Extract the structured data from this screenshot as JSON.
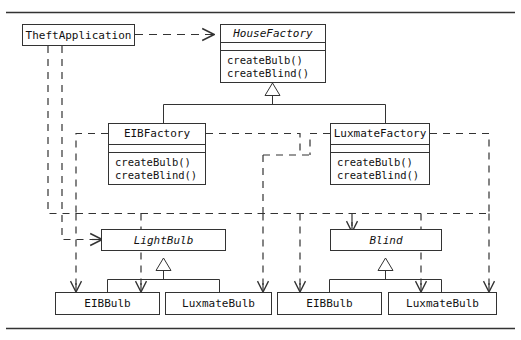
{
  "figure": {
    "type": "uml-class-diagram",
    "pattern": "Abstract Factory",
    "width": 521,
    "height": 340,
    "line_color": "#333333",
    "text_color": "#111111",
    "background": "#ffffff"
  },
  "classes": {
    "theft_application": {
      "name": "TheftApplication",
      "abstract": false,
      "compartments": 1,
      "operations": []
    },
    "house_factory": {
      "name": "HouseFactory",
      "abstract": true,
      "compartments": 3,
      "operations": [
        "createBulb()",
        "createBlind()"
      ]
    },
    "eib_factory": {
      "name": "EIBFactory",
      "abstract": false,
      "compartments": 3,
      "operations": [
        "createBulb()",
        "createBlind()"
      ]
    },
    "luxmate_factory": {
      "name": "LuxmateFactory",
      "abstract": false,
      "compartments": 3,
      "operations": [
        "createBulb()",
        "createBlind()"
      ]
    },
    "light_bulb": {
      "name": "LightBulb",
      "abstract": true,
      "compartments": 1,
      "operations": []
    },
    "blind": {
      "name": "Blind",
      "abstract": true,
      "compartments": 1,
      "operations": []
    },
    "eib_bulb_left": {
      "name": "EIBBulb",
      "abstract": false,
      "compartments": 1,
      "operations": []
    },
    "luxmate_bulb_left": {
      "name": "LuxmateBulb",
      "abstract": false,
      "compartments": 1,
      "operations": []
    },
    "eib_bulb_right": {
      "name": "EIBBulb",
      "abstract": false,
      "compartments": 1,
      "operations": []
    },
    "luxmate_bulb_right": {
      "name": "LuxmateBulb",
      "abstract": false,
      "compartments": 1,
      "operations": []
    }
  },
  "relationships": [
    {
      "kind": "dependency",
      "style": "dashed",
      "from": "TheftApplication",
      "to": "HouseFactory"
    },
    {
      "kind": "dependency",
      "style": "dashed",
      "from": "TheftApplication",
      "to": "LightBulb"
    },
    {
      "kind": "dependency",
      "style": "dashed",
      "from": "TheftApplication",
      "to": "Blind"
    },
    {
      "kind": "generalization",
      "style": "solid",
      "from": "EIBFactory",
      "to": "HouseFactory"
    },
    {
      "kind": "generalization",
      "style": "solid",
      "from": "LuxmateFactory",
      "to": "HouseFactory"
    },
    {
      "kind": "generalization",
      "style": "solid",
      "from": "EIBBulb",
      "to": "LightBulb"
    },
    {
      "kind": "generalization",
      "style": "solid",
      "from": "LuxmateBulb",
      "to": "LightBulb"
    },
    {
      "kind": "generalization",
      "style": "solid",
      "from": "EIBBulb",
      "to": "Blind"
    },
    {
      "kind": "generalization",
      "style": "solid",
      "from": "LuxmateBulb",
      "to": "Blind"
    },
    {
      "kind": "dependency",
      "style": "dashed",
      "from": "EIBFactory",
      "to": "EIBBulb"
    },
    {
      "kind": "dependency",
      "style": "dashed",
      "from": "EIBFactory",
      "to": "EIBBulb (Blind)"
    },
    {
      "kind": "dependency",
      "style": "dashed",
      "from": "LuxmateFactory",
      "to": "LuxmateBulb"
    },
    {
      "kind": "dependency",
      "style": "dashed",
      "from": "LuxmateFactory",
      "to": "LuxmateBulb (Blind)"
    },
    {
      "kind": "dependency",
      "style": "dashed",
      "from": "LuxmateFactory",
      "to": "Blind"
    }
  ]
}
